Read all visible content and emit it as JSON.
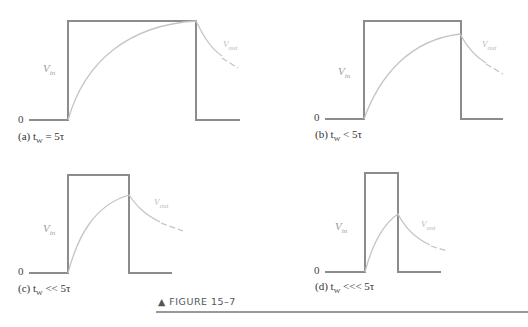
{
  "figure": {
    "caption": "▲ FIGURE 15–7",
    "rule_color": "#999999"
  },
  "panels": [
    {
      "id": "a",
      "label": "(a) t",
      "sub": "W",
      "relation": " = 5τ",
      "vin": "V",
      "vin_sub": "in",
      "vout": "V",
      "vout_sub": "out",
      "zero": "0"
    },
    {
      "id": "b",
      "label": "(b) t",
      "sub": "W",
      "relation": " < 5τ",
      "vin": "V",
      "vin_sub": "in",
      "vout": "V",
      "vout_sub": "out",
      "zero": "0"
    },
    {
      "id": "c",
      "label": "(c) t",
      "sub": "W",
      "relation": " << 5τ",
      "vin": "V",
      "vin_sub": "in",
      "vout": "V",
      "vout_sub": "out",
      "zero": "0"
    },
    {
      "id": "d",
      "label": "(d) t",
      "sub": "W",
      "relation": " <<< 5τ",
      "vin": "V",
      "vin_sub": "in",
      "vout": "V",
      "vout_sub": "out",
      "zero": "0"
    }
  ],
  "colors": {
    "pulse": "#8c8c8c",
    "curve": "#c0c0c0"
  }
}
